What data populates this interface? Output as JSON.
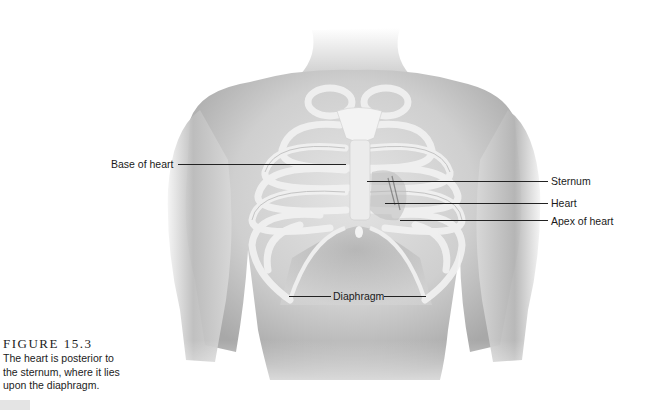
{
  "figure": {
    "number_label": "FIGURE 15.3",
    "caption": "The heart is posterior to the sternum, where it lies upon the diaphragm.",
    "caption_lines": [
      "The heart is posterior to",
      "the sternum, where it lies",
      "upon the diaphragm."
    ],
    "illustration": "grayscale anterior view of male torso with semi-transparent rib cage, sternum and heart"
  },
  "labels": {
    "base_of_heart": "Base of heart",
    "sternum": "Sternum",
    "heart": "Heart",
    "apex_of_heart": "Apex of heart",
    "diaphragm": "Diaphragm"
  },
  "colors": {
    "background": "#ffffff",
    "skin_light": "#e6e6e6",
    "skin_mid": "#c4c4c4",
    "skin_dark": "#8c8c8c",
    "bone": "#f2f2f2",
    "text": "#1a1a1a"
  }
}
